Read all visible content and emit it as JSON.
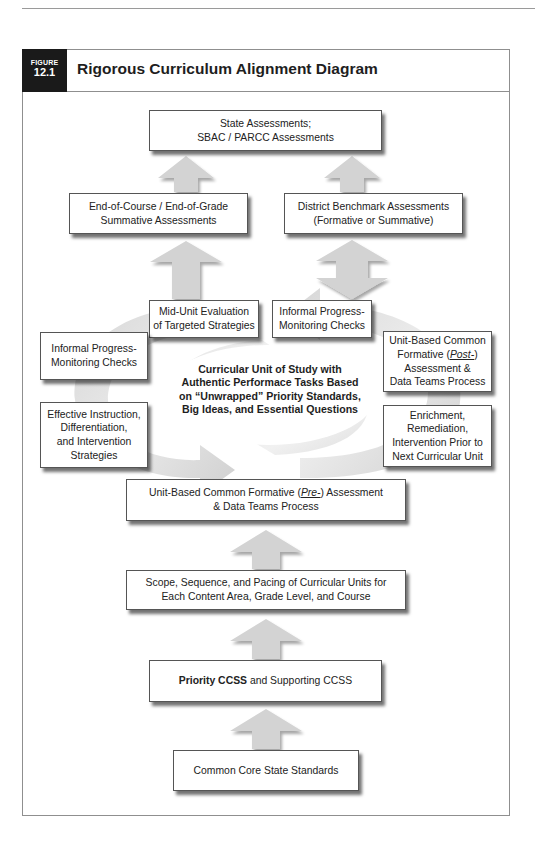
{
  "figure": {
    "badge_label": "FIGURE",
    "badge_number": "12.1",
    "title": "Rigorous Curriculum Alignment Diagram"
  },
  "nodes": {
    "state": {
      "line1": "State Assessments;",
      "line2": "SBAC / PARCC Assessments"
    },
    "end_of_course": {
      "line1": "End-of-Course / End-of-Grade",
      "line2": "Summative Assessments"
    },
    "district": {
      "line1": "District Benchmark Assessments",
      "line2": "(Formative or Summative)"
    },
    "mid_unit": {
      "line1": "Mid-Unit Evaluation",
      "line2": "of Targeted Strategies"
    },
    "informal_top": {
      "line1": "Informal Progress-",
      "line2": "Monitoring Checks"
    },
    "informal_left": {
      "line1": "Informal Progress-",
      "line2": "Monitoring Checks"
    },
    "effective": {
      "line1": "Effective Instruction,",
      "line2": "Differentiation,",
      "line3": "and Intervention",
      "line4": "Strategies"
    },
    "post": {
      "line1": "Unit-Based Common",
      "line2a": "Formative (",
      "line2b": "Post-",
      "line2c": ")",
      "line3": "Assessment &",
      "line4": "Data Teams Process"
    },
    "enrichment": {
      "line1": "Enrichment,",
      "line2": "Remediation,",
      "line3": "Intervention Prior to",
      "line4": "Next Curricular Unit"
    },
    "center": {
      "line1": "Curricular Unit of Study with",
      "line2": "Authentic Performace Tasks Based",
      "line3": "on “Unwrapped” Priority Standards,",
      "line4": "Big Ideas, and Essential Questions"
    },
    "pre": {
      "line1a": "Unit-Based Common Formative (",
      "line1b": "Pre-",
      "line1c": ") Assessment",
      "line2": "& Data Teams Process"
    },
    "scope": {
      "line1": "Scope, Sequence, and Pacing of Curricular Units for",
      "line2": "Each Content Area, Grade Level, and Course"
    },
    "priority": {
      "bold": "Priority CCSS",
      "rest": " and Supporting CCSS"
    },
    "ccss": {
      "line1": "Common Core State Standards"
    }
  },
  "edges": [
    {
      "from": "end_of_course",
      "to": "state",
      "type": "up-arrow"
    },
    {
      "from": "district",
      "to": "state",
      "type": "up-arrow"
    },
    {
      "from": "mid_unit",
      "to": "end_of_course",
      "type": "up-arrow"
    },
    {
      "from": "informal_top",
      "to": "district",
      "type": "double-arrow"
    },
    {
      "from": "scope",
      "to": "pre",
      "type": "up-arrow"
    },
    {
      "from": "priority",
      "to": "scope",
      "type": "up-arrow"
    },
    {
      "from": "ccss",
      "to": "priority",
      "type": "up-arrow"
    },
    {
      "from": "cycle",
      "to": "center",
      "type": "circular-arrows"
    }
  ],
  "colors": {
    "arrow_fill": "#d3d3d3",
    "cycle_fill": "#e2e2e2",
    "badge_bg": "#1a1a1a",
    "frame_border": "#8f8f8f"
  }
}
